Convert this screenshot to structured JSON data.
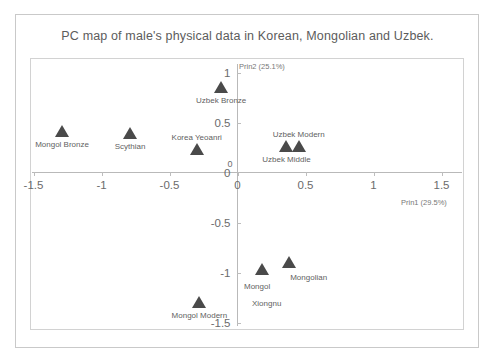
{
  "chart_data": {
    "type": "scatter",
    "title": "PC map of male's physical data in Korean, Mongolian and Uzbek.",
    "xlabel": "Prin1 (29.5%)",
    "ylabel": "Prin2 (25.1%)",
    "xlim": [
      -1.65,
      1.65
    ],
    "ylim": [
      -1.6,
      1.15
    ],
    "xticks": [
      "-1.5",
      "-1",
      "-0.5",
      "0",
      "0.5",
      "1",
      "1.5"
    ],
    "xtick_values": [
      -1.5,
      -1,
      -0.5,
      0,
      0.5,
      1,
      1.5
    ],
    "yticks": [
      "1",
      "0.5",
      "0",
      "-0.5",
      "-1",
      "-1.5"
    ],
    "ytick_values": [
      1,
      0.5,
      0,
      -0.5,
      -1,
      -1.5
    ],
    "grid": false,
    "legend": "none",
    "marker_shape": "triangle",
    "marker_color": "#4a4a4a",
    "points": [
      {
        "label": "Mongol Bronze",
        "x": -1.29,
        "y": 0.42,
        "label_pos": "below"
      },
      {
        "label": "Scythian",
        "x": -0.79,
        "y": 0.4,
        "label_pos": "below"
      },
      {
        "label": "Korea Yeoanri",
        "x": -0.3,
        "y": 0.24,
        "label_pos": "above"
      },
      {
        "label": "Uzbek Bronze",
        "x": -0.12,
        "y": 0.86,
        "label_pos": "below"
      },
      {
        "label": "Uzbek Modern",
        "x": 0.45,
        "y": 0.27,
        "label_pos": "above"
      },
      {
        "label": "Uzbek Middle",
        "x": 0.36,
        "y": 0.27,
        "label_pos": "below"
      },
      {
        "label": "Mongolian",
        "x": 0.38,
        "y": -0.89,
        "label_pos": "below-right"
      },
      {
        "label": "Mongol Xiongnu",
        "x": 0.18,
        "y": -0.96,
        "label_pos": "below-two-line"
      },
      {
        "label": "Mongol Modern",
        "x": -0.28,
        "y": -1.29,
        "label_pos": "below"
      }
    ]
  },
  "axis_titles": {
    "y_top": "Prin2 (25.1%)",
    "x_right": "Prin1 (29.5%)"
  }
}
